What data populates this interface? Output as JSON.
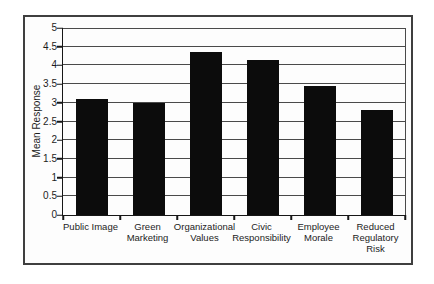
{
  "chart_data": {
    "type": "bar",
    "title": "",
    "xlabel": "",
    "ylabel": "Mean Response",
    "categories": [
      "Public Image",
      "Green Marketing",
      "Organizational Values",
      "Civic Responsibility",
      "Employee Morale",
      "Reduced Regulatory Risk"
    ],
    "values": [
      3.1,
      3.0,
      4.35,
      4.15,
      3.45,
      2.8
    ],
    "ylim": [
      0,
      5
    ],
    "yticks": [
      0,
      0.5,
      1,
      1.5,
      2,
      2.5,
      3,
      3.5,
      4,
      4.5,
      5
    ],
    "grid": "horizontal",
    "legend_position": "none",
    "bar_color": "#0c0c0c",
    "gridline_color": "#4a4a4a",
    "axis_color": "#161616",
    "frame_border_color": "#3f3f3f",
    "background_color": "#fdfdfd"
  }
}
